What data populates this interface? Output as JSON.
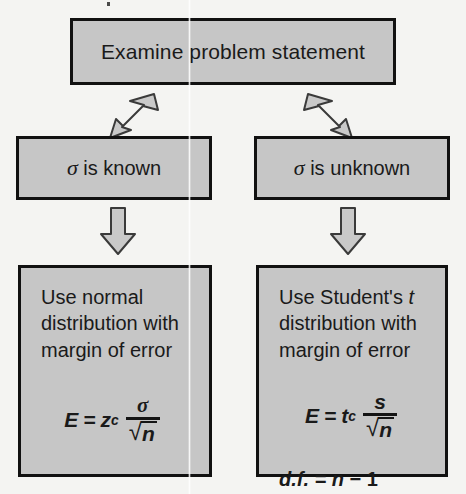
{
  "diagram": {
    "type": "flowchart",
    "title_text": "",
    "colors": {
      "box_fill": "#c6c6c6",
      "box_border": "#111111",
      "arrow_fill": "#c9c9c9",
      "arrow_border": "#3a3a3a",
      "page_background": "#f4f4f2",
      "text": "#1a1a1a"
    },
    "nodes": {
      "examine": {
        "label": "Examine problem statement"
      },
      "sigma_known": {
        "symbol": "σ",
        "label": " is known"
      },
      "sigma_unknown": {
        "symbol": "σ",
        "label": " is unknown"
      },
      "normal": {
        "line1": "Use normal",
        "line2": "distribution with",
        "line3": "margin of error",
        "formula": {
          "lhs": "E",
          "equals": "=",
          "coefficient": "z",
          "coefficient_sub": "c",
          "numerator": "σ",
          "denominator_radicand": "n",
          "radical": "√",
          "plain": "E = z_c σ/√n"
        }
      },
      "student": {
        "line1": "Use Student's t",
        "line1_plain": "Use Student's ",
        "line1_italic": "t",
        "line2": "distribution with",
        "line3": "margin of error",
        "formula": {
          "lhs": "E",
          "equals": "=",
          "coefficient": "t",
          "coefficient_sub": "c",
          "numerator": "s",
          "denominator_radicand": "n",
          "radical": "√",
          "plain": "E = t_c s/√n"
        },
        "df_line": {
          "label": "d.f.",
          "equals": "=",
          "variable": "n",
          "minus": "−",
          "value": "1",
          "plain": "d.f. = n − 1"
        }
      }
    },
    "arrows": [
      {
        "name": "examine-to-sigma-known",
        "direction": "down-left"
      },
      {
        "name": "examine-to-sigma-unknown",
        "direction": "down-right"
      },
      {
        "name": "sigma-known-to-normal",
        "direction": "down"
      },
      {
        "name": "sigma-unknown-to-student",
        "direction": "down"
      }
    ]
  }
}
